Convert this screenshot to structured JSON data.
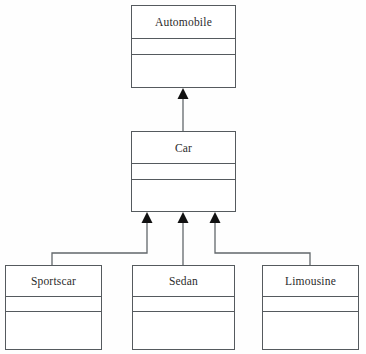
{
  "diagram": {
    "type": "uml-class-diagram",
    "background_color": "#fefefe",
    "line_color": "#62676b",
    "text_color": "#2b2b2b",
    "arrow_fill": "#111111"
  },
  "classes": [
    {
      "id": "automobile",
      "name": "Automobile",
      "x": 131,
      "y": 5,
      "width": 105,
      "height": 83,
      "name_height": 33,
      "attrs_height": 16,
      "attributes": [],
      "operations": []
    },
    {
      "id": "car",
      "name": "Car",
      "x": 131,
      "y": 131,
      "width": 105,
      "height": 81,
      "name_height": 32,
      "attrs_height": 16,
      "attributes": [],
      "operations": []
    },
    {
      "id": "sportscar",
      "name": "Sportscar",
      "x": 5,
      "y": 265,
      "width": 97,
      "height": 85,
      "name_height": 31,
      "attrs_height": 15,
      "attributes": [],
      "operations": []
    },
    {
      "id": "sedan",
      "name": "Sedan",
      "x": 132,
      "y": 265,
      "width": 103,
      "height": 85,
      "name_height": 31,
      "attrs_height": 15,
      "attributes": [],
      "operations": []
    },
    {
      "id": "limousine",
      "name": "Limousine",
      "x": 262,
      "y": 265,
      "width": 97,
      "height": 85,
      "name_height": 31,
      "attrs_height": 15,
      "attributes": [],
      "operations": []
    }
  ],
  "generalizations": [
    {
      "id": "car-to-automobile",
      "from": "car",
      "to": "automobile",
      "kind": "generalization",
      "arrow_style": "solid-filled-triangle",
      "path": "M 183 131 L 183 97",
      "arrow_points": "183,88 177.5,99 188.5,99"
    },
    {
      "id": "sportscar-to-car",
      "from": "sportscar",
      "to": "car",
      "kind": "generalization",
      "arrow_style": "solid-filled-triangle",
      "path": "M 52 265 L 52 253 L 147 253 L 147 221",
      "arrow_points": "147,212 141.5,223 152.5,223"
    },
    {
      "id": "sedan-to-car",
      "from": "sedan",
      "to": "car",
      "kind": "generalization",
      "arrow_style": "solid-filled-triangle",
      "path": "M 183 265 L 183 221",
      "arrow_points": "183,212 177.5,223 188.5,223"
    },
    {
      "id": "limousine-to-car",
      "from": "limousine",
      "to": "car",
      "kind": "generalization",
      "arrow_style": "solid-filled-triangle",
      "path": "M 310 265 L 310 253 L 215 253 L 215 221",
      "arrow_points": "215,212 209.5,223 220.5,223"
    }
  ]
}
